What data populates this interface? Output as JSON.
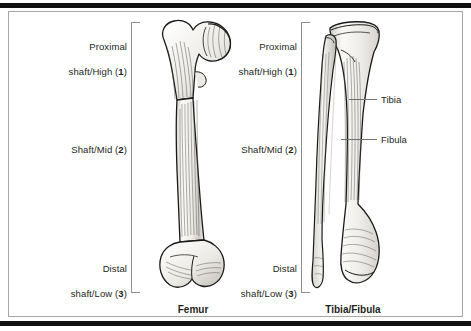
{
  "figure": {
    "frame_color": "#a7a7a7",
    "rule_color": "#111111",
    "text_color": "#231f20",
    "bone_fill": "#f2f1ee",
    "bone_outline": "#1a1a1a"
  },
  "panels": [
    {
      "id": "femur",
      "caption": "Femur",
      "regions": [
        {
          "label": "Proximal\nshaft/High (",
          "number": "1",
          "tail": ")"
        },
        {
          "label": "Shaft/Mid (",
          "number": "2",
          "tail": ")"
        },
        {
          "label": "Distal\nshaft/Low (",
          "number": "3",
          "tail": ")"
        }
      ],
      "region_text": [
        "Proximal shaft/High (1)",
        "Shaft/Mid (2)",
        "Distal shaft/Low (3)"
      ],
      "parts": []
    },
    {
      "id": "tibia-fibula",
      "caption": "Tibia/Fibula",
      "regions": [
        {
          "label": "Proximal\nshaft/High (",
          "number": "1",
          "tail": ")"
        },
        {
          "label": "Shaft/Mid (",
          "number": "2",
          "tail": ")"
        },
        {
          "label": "Distal\nshaft/Low (",
          "number": "3",
          "tail": ")"
        }
      ],
      "region_text": [
        "Proximal shaft/High (1)",
        "Shaft/Mid (2)",
        "Distal shaft/Low (3)"
      ],
      "parts": [
        {
          "label": "Tibia"
        },
        {
          "label": "Fibula"
        }
      ]
    }
  ],
  "labels": {
    "proximal_line1": "Proximal",
    "proximal_line2_pre": "shaft/High (",
    "proximal_num": "1",
    "proximal_post": ")",
    "mid_pre": "Shaft/Mid (",
    "mid_num": "2",
    "mid_post": ")",
    "distal_line1": "Distal",
    "distal_line2_pre": "shaft/Low (",
    "distal_num": "3",
    "distal_post": ")",
    "tibia": "Tibia",
    "fibula": "Fibula",
    "caption_femur": "Femur",
    "caption_tibfib": "Tibia/Fibula"
  }
}
